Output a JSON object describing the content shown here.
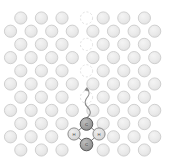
{
  "figure": {
    "width": 173,
    "height": 162,
    "background_color": "#ffffff"
  },
  "colors": {
    "lattice_fill": "#e9e9e9",
    "lattice_stroke": "#c9c9c9",
    "vacancy_stroke": "#dcdcdc",
    "defect_fill": "#9c9c9c",
    "defect_stroke": "#5a5a5a",
    "neighbor_fill": "#dcdcdc",
    "neighbor_stroke": "#7c7c7c",
    "bond_stroke": "#6a6a6a",
    "path_stroke": "#8a8a8a",
    "label_color": "#2b2b2b"
  },
  "geometry": {
    "atom_radius": 6.1,
    "defect_radius": 6.3,
    "row_spacing": 13.2,
    "col_spacing": 20.6,
    "row_offset": 10.3,
    "origin_x": 10.5,
    "origin_y": 18.0
  },
  "lattice": {
    "description": "Two-dimensional close-packed lattice of host atoms drawn as light grey circles arranged in offset rows.",
    "row_count": 11,
    "rows": [
      {
        "index": 0,
        "y": 18.0,
        "x_start": 20.8,
        "count": 7,
        "shift": "odd"
      },
      {
        "index": 1,
        "y": 31.2,
        "x_start": 10.5,
        "count": 8,
        "shift": "even"
      },
      {
        "index": 2,
        "y": 44.4,
        "x_start": 20.8,
        "count": 7,
        "shift": "odd"
      },
      {
        "index": 3,
        "y": 57.6,
        "x_start": 10.5,
        "count": 8,
        "shift": "even"
      },
      {
        "index": 4,
        "y": 70.8,
        "x_start": 20.8,
        "count": 7,
        "shift": "odd"
      },
      {
        "index": 5,
        "y": 84.0,
        "x_start": 10.5,
        "count": 8,
        "shift": "even"
      },
      {
        "index": 6,
        "y": 97.2,
        "x_start": 20.8,
        "count": 7,
        "shift": "odd"
      },
      {
        "index": 7,
        "y": 110.4,
        "x_start": 10.5,
        "count": 8,
        "shift": "even"
      },
      {
        "index": 8,
        "y": 123.6,
        "x_start": 20.8,
        "count": 7,
        "shift": "odd"
      },
      {
        "index": 9,
        "y": 136.8,
        "x_start": 10.5,
        "count": 8,
        "shift": "even"
      },
      {
        "index": 10,
        "y": 150.0,
        "x_start": 20.8,
        "count": 7,
        "shift": "odd"
      }
    ]
  },
  "vacancy_trail": {
    "description": "Dashed faint circles marking the successive vacancy sites left behind along the central column as the defect migrated upward.",
    "style": "dashed",
    "sites": [
      {
        "label": "v1",
        "x": 86.5,
        "y": 18.0
      },
      {
        "label": "v2",
        "x": 86.5,
        "y": 44.4
      },
      {
        "label": "v3",
        "x": 86.5,
        "y": 70.8
      },
      {
        "label": "v4",
        "x": 86.5,
        "y": 97.2
      }
    ]
  },
  "migration_path": {
    "description": "Wavy grey trace showing the diffusion trajectory from the defect complex upward through the vacancy trail.",
    "stroke_width": 1.1,
    "dash": "2.2 1.6"
  },
  "defect_complex": {
    "description": "Rhombic defect cluster at the lower centre of the lattice: two dark interstitial atoms with two lighter neighbour atoms, joined by bonds.",
    "atoms": [
      {
        "id": "top",
        "role": "interstitial",
        "label": "C",
        "x": 86.5,
        "y": 124.0,
        "kind": "dark"
      },
      {
        "id": "left",
        "role": "host-neighbor",
        "label": "H",
        "x": 74.0,
        "y": 134.0,
        "kind": "light"
      },
      {
        "id": "right",
        "role": "host-neighbor",
        "label": "H",
        "x": 99.0,
        "y": 134.0,
        "kind": "light"
      },
      {
        "id": "bottom",
        "role": "interstitial",
        "label": "C",
        "x": 86.5,
        "y": 144.5,
        "kind": "dark"
      }
    ],
    "bonds": [
      {
        "from": "top",
        "to": "left"
      },
      {
        "from": "top",
        "to": "right"
      },
      {
        "from": "left",
        "to": "bottom"
      },
      {
        "from": "right",
        "to": "bottom"
      }
    ]
  }
}
